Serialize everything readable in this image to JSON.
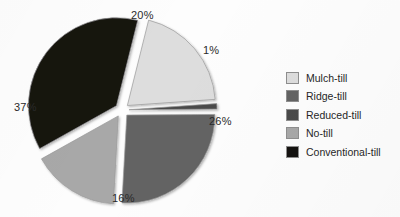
{
  "chart_data": {
    "type": "pie",
    "title": "",
    "categories": [
      "Mulch-till",
      "Reduced-till",
      "Ridge-till",
      "No-till",
      "Conventional-till"
    ],
    "values": [
      20,
      1,
      26,
      16,
      37
    ],
    "labels": [
      "20%",
      "1%",
      "26%",
      "16%",
      "37%"
    ],
    "unit": "%",
    "legend_position": "right",
    "exploded": true,
    "grid": false,
    "colors": [
      "#dddddd",
      "#4a4a4a",
      "#636363",
      "#a8a8a8",
      "#141210"
    ],
    "slices": [
      {
        "label": "Mulch-till",
        "value": 20,
        "display": "20%",
        "color": "#dddddd"
      },
      {
        "label": "Reduced-till",
        "value": 1,
        "display": "1%",
        "color": "#4a4a4a"
      },
      {
        "label": "Ridge-till",
        "value": 26,
        "display": "26%",
        "color": "#636363"
      },
      {
        "label": "No-till",
        "value": 16,
        "display": "16%",
        "color": "#a8a8a8"
      },
      {
        "label": "Conventional-till",
        "value": 37,
        "display": "37%",
        "color": "#141210"
      }
    ]
  },
  "legend": {
    "items": [
      {
        "label": "Mulch-till",
        "color": "#dddddd"
      },
      {
        "label": "Ridge-till",
        "color": "#636363"
      },
      {
        "label": "Reduced-till",
        "color": "#4a4a4a"
      },
      {
        "label": "No-till",
        "color": "#a8a8a8"
      },
      {
        "label": "Conventional-till",
        "color": "#141210"
      }
    ]
  }
}
